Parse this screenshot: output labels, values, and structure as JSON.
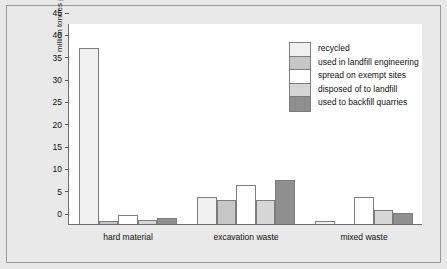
{
  "chart_data": {
    "type": "bar",
    "title": "",
    "xlabel": "",
    "ylabel": "million tonnes per year",
    "ylim": [
      0,
      45
    ],
    "yticks": [
      0,
      5,
      10,
      15,
      20,
      25,
      30,
      35,
      40,
      45
    ],
    "grid": false,
    "legend_position": "upper right",
    "categories": [
      "hard material",
      "excavation waste",
      "mixed waste"
    ],
    "series": [
      {
        "name": "recycled",
        "color": "#f0f0f0",
        "values": [
          39.5,
          6.0,
          0.6
        ]
      },
      {
        "name": "used in landfill engineering",
        "color": "#c6c6c6",
        "values": [
          0.7,
          5.4,
          0.0
        ]
      },
      {
        "name": "spread on exempt sites",
        "color": "#ffffff",
        "values": [
          2.1,
          8.7,
          6.0
        ]
      },
      {
        "name": "disposed of to landfill",
        "color": "#d6d6d6",
        "values": [
          0.9,
          5.4,
          3.2
        ]
      },
      {
        "name": "used to backfill quarries",
        "color": "#8f8f8f",
        "values": [
          1.4,
          9.9,
          2.4
        ]
      }
    ]
  },
  "colors": {
    "figure_background": "#e8e8e8",
    "plot_background": "#ffffff",
    "frame_border": "#9a9a9a",
    "axis_line": "#6e6e6e",
    "bar_outline": "#7d7d7d",
    "text": "#111111"
  }
}
